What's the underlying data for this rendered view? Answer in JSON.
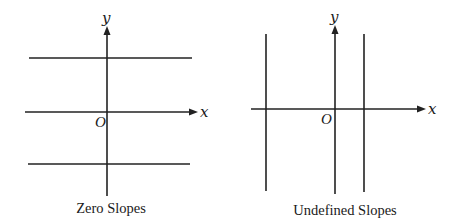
{
  "figure": {
    "panels": [
      {
        "id": "zero-slopes",
        "caption": "Zero Slopes",
        "x_axis_label": "x",
        "y_axis_label": "y",
        "origin_label": "O",
        "line_orientation": "horizontal",
        "line_count": 2
      },
      {
        "id": "undefined-slopes",
        "caption": "Undefined Slopes",
        "x_axis_label": "x",
        "y_axis_label": "y",
        "origin_label": "O",
        "line_orientation": "vertical",
        "line_count": 2
      }
    ],
    "colors": {
      "line": "#222222",
      "background": "#ffffff",
      "text": "#1a1a1a"
    }
  }
}
